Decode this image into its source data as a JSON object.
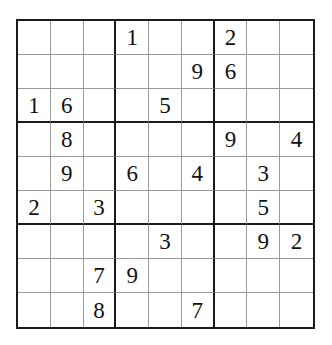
{
  "puzzle": {
    "type": "sudoku",
    "grid": [
      [
        "",
        "",
        "",
        "1",
        "",
        "",
        "2",
        "",
        ""
      ],
      [
        "",
        "",
        "",
        "",
        "",
        "9",
        "6",
        "",
        ""
      ],
      [
        "1",
        "6",
        "",
        "",
        "5",
        "",
        "",
        "",
        ""
      ],
      [
        "",
        "8",
        "",
        "",
        "",
        "",
        "9",
        "",
        "4"
      ],
      [
        "",
        "9",
        "",
        "6",
        "",
        "4",
        "",
        "3",
        ""
      ],
      [
        "2",
        "",
        "3",
        "",
        "",
        "",
        "",
        "5",
        ""
      ],
      [
        "",
        "",
        "",
        "",
        "3",
        "",
        "",
        "9",
        "2"
      ],
      [
        "",
        "",
        "7",
        "9",
        "",
        "",
        "",
        "",
        ""
      ],
      [
        "",
        "",
        "8",
        "",
        "",
        "7",
        "",
        "",
        ""
      ]
    ]
  }
}
